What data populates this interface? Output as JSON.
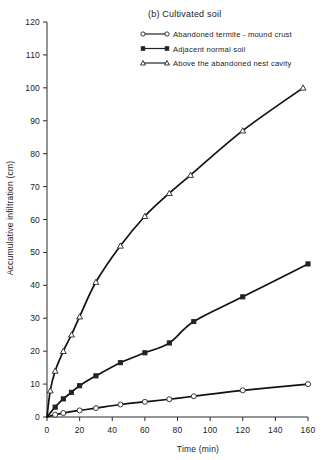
{
  "figure": {
    "title": "(b) Cultivated soil"
  },
  "legend": {
    "position": "top-right",
    "entries": [
      {
        "label": "Abandoned termite - mound crust",
        "marker": "open-circle-marker"
      },
      {
        "label": "Adjacent normal soil",
        "marker": "filled-square-marker"
      },
      {
        "label": "Above the abandoned nest cavity",
        "marker": "open-triangle-marker"
      }
    ]
  },
  "axes": {
    "x": {
      "label": "Time (min)",
      "ticks": [
        "0",
        "20",
        "40",
        "60",
        "80",
        "100",
        "120",
        "140",
        "160"
      ],
      "min": 0,
      "max": 160
    },
    "y": {
      "label": "Accumulative infiltration (cm)",
      "ticks": [
        "0",
        "10",
        "20",
        "30",
        "40",
        "50",
        "60",
        "70",
        "80",
        "90",
        "100",
        "110",
        "120"
      ],
      "min": 0,
      "max": 120
    }
  },
  "chart_data": {
    "type": "line",
    "title": "(b) Cultivated soil",
    "xlabel": "Time (min)",
    "ylabel": "Accumulative infiltration (cm)",
    "xlim": [
      0,
      160
    ],
    "ylim": [
      0,
      120
    ],
    "grid": false,
    "legend_position": "top-right",
    "series": [
      {
        "name": "Above the abandoned nest cavity",
        "marker": "open-triangle",
        "x": [
          0,
          2,
          5,
          10,
          15,
          20,
          30,
          45,
          60,
          75,
          88,
          120,
          157
        ],
        "y": [
          0,
          8,
          14,
          20,
          25,
          30.5,
          41,
          52,
          61,
          68,
          73.5,
          87,
          100
        ]
      },
      {
        "name": "Adjacent normal soil",
        "marker": "filled-square",
        "x": [
          0,
          5,
          10,
          15,
          20,
          30,
          45,
          60,
          75,
          90,
          120,
          160
        ],
        "y": [
          0,
          3,
          5.5,
          7.5,
          9.5,
          12.5,
          16.5,
          19.5,
          22.5,
          29,
          36.5,
          46.5
        ]
      },
      {
        "name": "Abandoned termite - mound crust",
        "marker": "open-circle",
        "x": [
          0,
          5,
          10,
          20,
          30,
          45,
          60,
          75,
          90,
          120,
          160
        ],
        "y": [
          0,
          0.7,
          1.2,
          2.0,
          2.7,
          3.8,
          4.6,
          5.4,
          6.3,
          8.1,
          10.0
        ]
      }
    ]
  }
}
